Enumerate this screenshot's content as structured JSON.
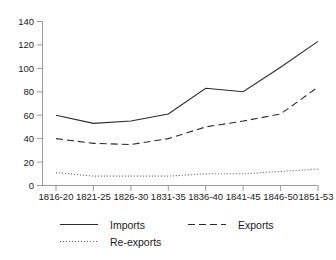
{
  "chart_data": {
    "type": "line",
    "title": "",
    "subtitle": "",
    "xlabel": "",
    "ylabel": "",
    "categories": [
      "1816-20",
      "1821-25",
      "1826-30",
      "1831-35",
      "1836-40",
      "1841-45",
      "1846-50",
      "1851-53"
    ],
    "series": [
      {
        "name": "Imports",
        "style": "solid",
        "values": [
          60,
          53,
          55,
          61,
          83,
          80,
          101,
          123
        ]
      },
      {
        "name": "Exports",
        "style": "dashed",
        "values": [
          40,
          36,
          35,
          40,
          50,
          55,
          61,
          84
        ]
      },
      {
        "name": "Re-exports",
        "style": "dotted",
        "values": [
          11,
          8,
          8,
          8,
          10,
          10,
          12,
          14
        ]
      }
    ],
    "ylim": [
      0,
      140
    ],
    "yticks": [
      0,
      20,
      40,
      60,
      80,
      100,
      120,
      140
    ],
    "ytick_labels": [
      "0",
      "20",
      "40",
      "60",
      "80",
      "100",
      "120",
      "140"
    ],
    "grid": false,
    "legend_position": "bottom",
    "legend": [
      {
        "label": "Imports",
        "style": "solid"
      },
      {
        "label": "Exports",
        "style": "dashed"
      },
      {
        "label": "Re-exports",
        "style": "dotted"
      }
    ],
    "colors": {
      "imports": "#2b2b2b",
      "exports": "#2b2b2b",
      "reexports": "#5a5a5a",
      "axis": "#9a9a9a",
      "text": "#1a1a1a",
      "background": "#ffffff"
    }
  }
}
